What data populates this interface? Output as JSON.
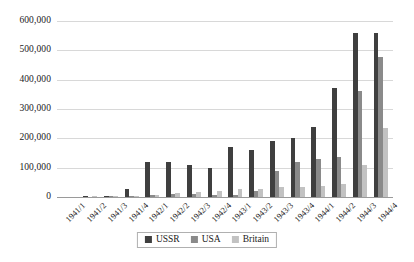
{
  "chart_data": {
    "type": "bar",
    "title": "",
    "xlabel": "",
    "ylabel": "",
    "ylim": [
      0,
      600000
    ],
    "ytick_step": 100000,
    "grid": true,
    "legend_position": "bottom",
    "categories": [
      "1941/1",
      "1941/2",
      "1941/3",
      "1941/4",
      "1942/1",
      "1942/2",
      "1942/3",
      "1942/4",
      "1943/1",
      "1943/2",
      "1943/3",
      "1943/4",
      "1944/1",
      "1944/2",
      "1944/3",
      "1944/4"
    ],
    "ytick_labels": [
      "0",
      "100,000",
      "200,000",
      "300,000",
      "400,000",
      "500,000",
      "600,000"
    ],
    "ytick_values": [
      0,
      100000,
      200000,
      300000,
      400000,
      500000,
      600000
    ],
    "series": [
      {
        "name": "USSR",
        "color": "#3f3f3f",
        "values": [
          0,
          1000,
          2000,
          27000,
          120000,
          120000,
          110000,
          100000,
          170000,
          160000,
          190000,
          200000,
          240000,
          370000,
          560000,
          560000
        ]
      },
      {
        "name": "USA",
        "color": "#8a8a8a",
        "values": [
          0,
          0,
          1000,
          3000,
          6000,
          10000,
          9000,
          6000,
          7000,
          19000,
          87000,
          120000,
          130000,
          138000,
          360000,
          478000
        ]
      },
      {
        "name": "Britain",
        "color": "#c2c2c2",
        "values": [
          0,
          1000,
          4000,
          5000,
          7000,
          14000,
          17000,
          21000,
          26000,
          29000,
          34000,
          35000,
          37000,
          43000,
          110000,
          236000
        ]
      }
    ]
  },
  "legend": {
    "items": [
      {
        "label": "USSR",
        "color": "#3f3f3f"
      },
      {
        "label": "USA",
        "color": "#8a8a8a"
      },
      {
        "label": "Britain",
        "color": "#c2c2c2"
      }
    ]
  }
}
